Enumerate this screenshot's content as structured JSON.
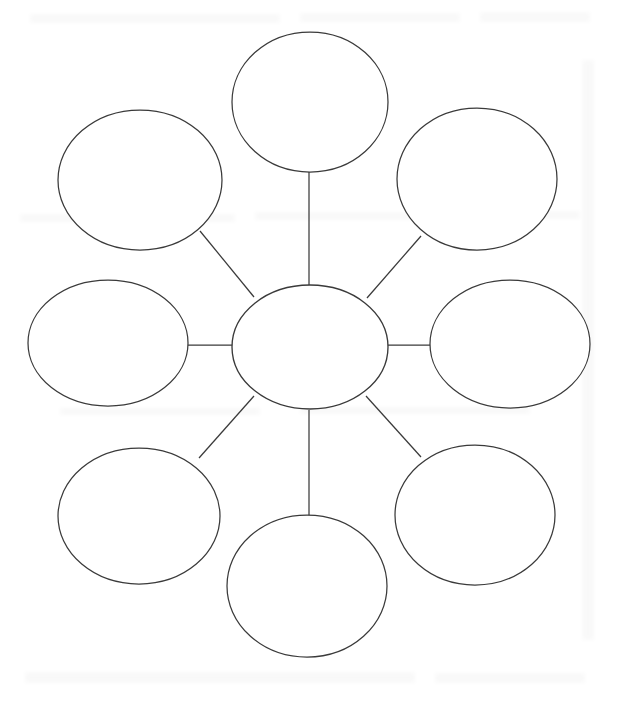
{
  "page": {
    "title": "",
    "background_color": "#ffffff",
    "width": 620,
    "height": 702
  },
  "diagram": {
    "type": "bubble-map",
    "stroke_color": "#3a3a3a",
    "fill_color": "#ffffff",
    "stroke_width": 1.25,
    "center": {
      "label": "",
      "cx": 310,
      "cy": 347,
      "rx": 78,
      "ry": 62
    },
    "nodes": [
      {
        "id": "node-top",
        "label": "",
        "cx": 310,
        "cy": 102,
        "rx": 78,
        "ry": 70
      },
      {
        "id": "node-top-right",
        "label": "",
        "cx": 477,
        "cy": 179,
        "rx": 80,
        "ry": 71
      },
      {
        "id": "node-right",
        "label": "",
        "cx": 510,
        "cy": 344,
        "rx": 80,
        "ry": 64
      },
      {
        "id": "node-bottom-right",
        "label": "",
        "cx": 475,
        "cy": 515,
        "rx": 80,
        "ry": 70
      },
      {
        "id": "node-bottom",
        "label": "",
        "cx": 307,
        "cy": 586,
        "rx": 80,
        "ry": 71
      },
      {
        "id": "node-bottom-left",
        "label": "",
        "cx": 139,
        "cy": 516,
        "rx": 81,
        "ry": 68
      },
      {
        "id": "node-left",
        "label": "",
        "cx": 108,
        "cy": 343,
        "rx": 80,
        "ry": 63
      },
      {
        "id": "node-top-left",
        "label": "",
        "cx": 140,
        "cy": 180,
        "rx": 82,
        "ry": 70
      }
    ],
    "spokes": [
      {
        "id": "spoke-top",
        "x1": 309,
        "y1": 172,
        "x2": 309,
        "y2": 285
      },
      {
        "id": "spoke-top-right",
        "x1": 421,
        "y1": 236,
        "x2": 367,
        "y2": 298
      },
      {
        "id": "spoke-right",
        "x1": 388,
        "y1": 345,
        "x2": 430,
        "y2": 345
      },
      {
        "id": "spoke-bottom-right",
        "x1": 366,
        "y1": 396,
        "x2": 421,
        "y2": 457
      },
      {
        "id": "spoke-bottom",
        "x1": 309,
        "y1": 410,
        "x2": 309,
        "y2": 516
      },
      {
        "id": "spoke-bottom-left",
        "x1": 254,
        "y1": 396,
        "x2": 199,
        "y2": 458
      },
      {
        "id": "spoke-left",
        "x1": 188,
        "y1": 345,
        "x2": 233,
        "y2": 345
      },
      {
        "id": "spoke-top-left",
        "x1": 200,
        "y1": 231,
        "x2": 254,
        "y2": 297
      }
    ]
  }
}
